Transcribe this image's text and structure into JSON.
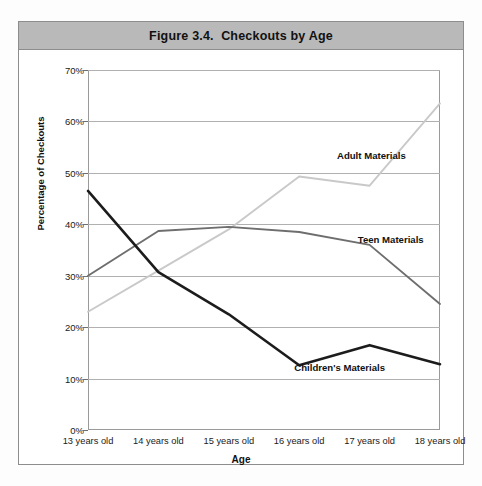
{
  "figure": {
    "title": "Figure 3.4.  Checkouts by Age"
  },
  "chart_data": {
    "type": "line",
    "title": "Figure 3.4.  Checkouts by Age",
    "xlabel": "Age",
    "ylabel": "Percentage of Checkouts",
    "categories": [
      "13 years old",
      "14 years old",
      "15 years old",
      "16 years old",
      "17 years old",
      "18 years old"
    ],
    "ylim": [
      0,
      70
    ],
    "yticks": [
      "0%",
      "10%",
      "20%",
      "30%",
      "40%",
      "50%",
      "60%",
      "70%"
    ],
    "ytick_values": [
      0,
      10,
      20,
      30,
      40,
      50,
      60,
      70
    ],
    "grid": true,
    "legend_position": "inline-labels",
    "series": [
      {
        "name": "Adult Materials",
        "color": "#c9c9c9",
        "values": [
          23.0,
          31.0,
          39.0,
          49.3,
          47.5,
          63.5
        ]
      },
      {
        "name": "Teen Materials",
        "color": "#6e6e6e",
        "values": [
          30.0,
          38.7,
          39.5,
          38.5,
          36.0,
          24.5
        ]
      },
      {
        "name": "Children's Materials",
        "color": "#1c1c1c",
        "values": [
          46.5,
          30.7,
          22.5,
          12.6,
          16.5,
          12.8
        ]
      }
    ],
    "series_labels": [
      {
        "text": "Adult Materials",
        "x_pct": 80.5,
        "y_pct": 23.5
      },
      {
        "text": "Teen Materials",
        "x_pct": 86.0,
        "y_pct": 47.0
      },
      {
        "text": "Children's Materials",
        "x_pct": 71.5,
        "y_pct": 82.5
      }
    ]
  }
}
